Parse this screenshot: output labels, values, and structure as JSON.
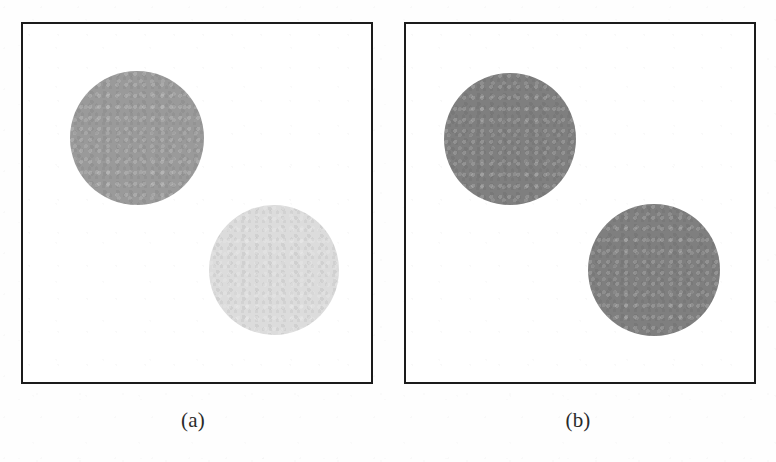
{
  "figure": {
    "background_color": "#fefefe",
    "border_color": "#1b1b1b",
    "width": 776,
    "height": 462
  },
  "panels": [
    {
      "id": "a",
      "caption": "(a)",
      "frame": {
        "x": 21,
        "y": 22,
        "width": 352,
        "height": 362
      },
      "disks": [
        {
          "name": "upper-left-disk",
          "fill": "#9a9a9a",
          "gray_level": 154,
          "cx": 114,
          "cy": 114,
          "r": 67
        },
        {
          "name": "lower-right-disk",
          "fill": "#dcdcdc",
          "gray_level": 220,
          "cx": 251,
          "cy": 246,
          "r": 65
        }
      ]
    },
    {
      "id": "b",
      "caption": "(b)",
      "frame": {
        "x": 404,
        "y": 22,
        "width": 352,
        "height": 362
      },
      "disks": [
        {
          "name": "upper-left-disk",
          "fill": "#7f7f7f",
          "gray_level": 127,
          "cx": 104,
          "cy": 115,
          "r": 66
        },
        {
          "name": "lower-right-disk",
          "fill": "#7f7f7f",
          "gray_level": 127,
          "cx": 248,
          "cy": 246,
          "r": 66
        }
      ]
    }
  ],
  "chart_data": {
    "type": "scatter",
    "title": "",
    "xlabel": "",
    "ylabel": "",
    "annotations": [
      "(a)",
      "(b)"
    ],
    "legend": [],
    "grid": false,
    "series": [
      {
        "name": "panel-a-disks",
        "points": [
          {
            "label": "upper-left",
            "x": 114,
            "y": 114,
            "radius": 67,
            "gray": 154
          },
          {
            "label": "lower-right",
            "x": 251,
            "y": 246,
            "radius": 65,
            "gray": 220
          }
        ]
      },
      {
        "name": "panel-b-disks",
        "points": [
          {
            "label": "upper-left",
            "x": 104,
            "y": 115,
            "radius": 66,
            "gray": 127
          },
          {
            "label": "lower-right",
            "x": 248,
            "y": 246,
            "radius": 66,
            "gray": 127
          }
        ]
      }
    ]
  }
}
